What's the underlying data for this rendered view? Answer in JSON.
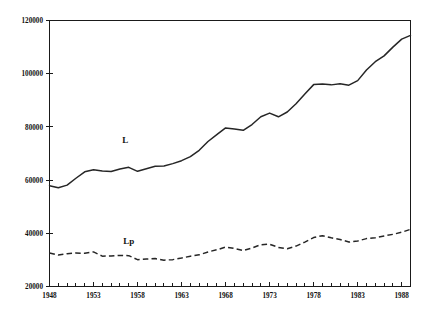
{
  "chart_data": {
    "type": "line",
    "title": "",
    "subtitle": "",
    "xlabel": "",
    "ylabel": "",
    "xlim": [
      1948,
      1989
    ],
    "ylim": [
      20000,
      120000
    ],
    "grid": false,
    "legend_position": "inline-annotation",
    "y_ticks": [
      20000,
      40000,
      60000,
      80000,
      100000,
      120000
    ],
    "y_tick_labels": [
      "20000",
      "40000",
      "60000",
      "80000",
      "100000",
      "120000"
    ],
    "x_ticks": [
      1948,
      1949,
      1950,
      1951,
      1952,
      1953,
      1954,
      1955,
      1956,
      1957,
      1958,
      1959,
      1960,
      1961,
      1962,
      1963,
      1964,
      1965,
      1966,
      1967,
      1968,
      1969,
      1970,
      1971,
      1972,
      1973,
      1974,
      1975,
      1976,
      1977,
      1978,
      1979,
      1980,
      1981,
      1982,
      1983,
      1984,
      1985,
      1986,
      1987,
      1988,
      1989
    ],
    "x_tick_labels_shown": [
      "1948",
      "1953",
      "1958",
      "1963",
      "1968",
      "1973",
      "1978",
      "1983",
      "1988"
    ],
    "x_tick_labels_shown_values": [
      1948,
      1953,
      1958,
      1963,
      1968,
      1973,
      1978,
      1983,
      1988
    ],
    "x": [
      1948,
      1949,
      1950,
      1951,
      1952,
      1953,
      1954,
      1955,
      1956,
      1957,
      1958,
      1959,
      1960,
      1961,
      1962,
      1963,
      1964,
      1965,
      1966,
      1967,
      1968,
      1969,
      1970,
      1971,
      1972,
      1973,
      1974,
      1975,
      1976,
      1977,
      1978,
      1979,
      1980,
      1981,
      1982,
      1983,
      1984,
      1985,
      1986,
      1987,
      1988,
      1989
    ],
    "series": [
      {
        "name": "L",
        "style": "solid",
        "annotation_label": "L",
        "annotation_x": 1956.6,
        "annotation_y": 73800,
        "values": [
          57900,
          57100,
          58100,
          60700,
          63100,
          63900,
          63400,
          63200,
          64200,
          64800,
          63300,
          64300,
          65200,
          65300,
          66200,
          67300,
          68800,
          71200,
          74500,
          77100,
          79600,
          79200,
          78700,
          80900,
          83800,
          85200,
          83800,
          85600,
          88700,
          92400,
          95900,
          96100,
          95800,
          96200,
          95700,
          97400,
          101400,
          104500,
          106700,
          110000,
          113000,
          114400
        ]
      },
      {
        "name": "Lp",
        "style": "dashed",
        "annotation_label": "Lp",
        "annotation_x": 1957.0,
        "annotation_y": 36000,
        "values": [
          32600,
          31800,
          32300,
          32600,
          32500,
          33000,
          31400,
          31500,
          31700,
          31600,
          30100,
          30300,
          30500,
          29900,
          30100,
          30700,
          31400,
          31900,
          33000,
          33800,
          34800,
          34300,
          33500,
          34500,
          35700,
          35900,
          34700,
          34200,
          35200,
          36700,
          38400,
          39100,
          38300,
          37700,
          36700,
          37100,
          38000,
          38300,
          39000,
          39600,
          40400,
          41500
        ]
      }
    ]
  },
  "annotations": {
    "series_l_label": "L",
    "series_lp_label": "Lp"
  }
}
